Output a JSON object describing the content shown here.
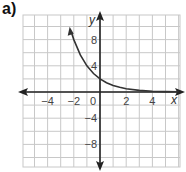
{
  "figure_label": "a)",
  "chart_data": {
    "type": "line",
    "title": "",
    "xlabel": "x",
    "ylabel": "y",
    "function": "y = 2(1/2)^x",
    "x_ticks": [
      "-4",
      "-2",
      "0",
      "2",
      "4"
    ],
    "y_ticks": [
      "8",
      "4",
      "-4",
      "-8"
    ],
    "xlim": [
      -5.75,
      6
    ],
    "ylim": [
      -11.5,
      11.5
    ],
    "grid": true,
    "x_grid_step": 1,
    "y_grid_step": 2,
    "series": [
      {
        "name": "curve",
        "x": [
          -2.2,
          -2,
          -1.5,
          -1,
          -0.5,
          0,
          0.5,
          1,
          1.5,
          2,
          3,
          4,
          5,
          6
        ],
        "y": [
          9.19,
          8,
          5.66,
          4,
          2.83,
          2,
          1.41,
          1,
          0.71,
          0.5,
          0.25,
          0.125,
          0.0625,
          0.03
        ]
      }
    ],
    "colors": {
      "grid": "#c8c8c8",
      "axes": "#222222",
      "curve": "#333333"
    }
  }
}
